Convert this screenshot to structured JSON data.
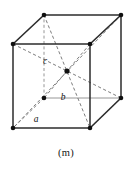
{
  "figure": {
    "caption": "(m)",
    "stroke_color": "#2b2b2b",
    "hidden_stroke_color": "#6e6e6e",
    "vertex_color": "#101010",
    "background": "#ffffff",
    "labels": {
      "a": "a",
      "b": "b",
      "c": "c"
    },
    "label_positions": {
      "a": {
        "x": 36,
        "y": 122
      },
      "b": {
        "x": 63,
        "y": 100
      },
      "c": {
        "x": 45,
        "y": 64
      }
    },
    "geometry": {
      "front_top_left": {
        "x": 13,
        "y": 44
      },
      "front_top_right": {
        "x": 90,
        "y": 44
      },
      "front_bottom_left": {
        "x": 13,
        "y": 128
      },
      "front_bottom_right": {
        "x": 90,
        "y": 128
      },
      "back_top_left": {
        "x": 44,
        "y": 15
      },
      "back_top_right": {
        "x": 121,
        "y": 15
      },
      "back_bottom_left": {
        "x": 44,
        "y": 98
      },
      "back_bottom_right": {
        "x": 121,
        "y": 98
      },
      "body_center": {
        "x": 67,
        "y": 71
      }
    },
    "vertex_radius": 2.2,
    "center_radius": 2.4,
    "solid_edges": [
      "front_top_left-front_top_right",
      "front_top_right-front_bottom_right",
      "front_bottom_right-front_bottom_left",
      "front_bottom_left-front_top_left",
      "back_top_left-back_top_right",
      "back_top_right-back_bottom_right",
      "back_bottom_right-back_bottom_left",
      "front_top_left-back_top_left",
      "front_top_right-back_top_right",
      "front_bottom_right-back_bottom_right"
    ],
    "dashed_edges": [
      "back_bottom_left-front_bottom_left",
      "back_bottom_left-back_top_left"
    ],
    "dashed_diagonals": [
      "back_top_left-front_bottom_right",
      "front_top_left-back_bottom_right",
      "front_top_right-back_bottom_left",
      "back_top_right-front_bottom_left"
    ]
  }
}
